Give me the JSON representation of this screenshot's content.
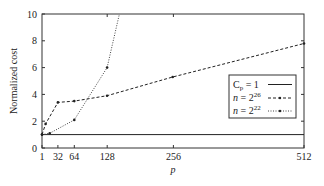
{
  "chart_data": {
    "type": "line",
    "title": "",
    "xlabel": "p",
    "ylabel": "Normalized cost",
    "xlim": [
      1,
      512
    ],
    "ylim": [
      0,
      10
    ],
    "x_ticks": [
      1,
      32,
      64,
      128,
      256,
      512
    ],
    "y_ticks": [
      0,
      2,
      4,
      6,
      8,
      10
    ],
    "grid": false,
    "legend_position": "right, mid",
    "series": [
      {
        "name": "C_p = 1",
        "style": "solid",
        "x": [
          1,
          512
        ],
        "y": [
          1,
          1
        ]
      },
      {
        "name": "n = 2^26",
        "style": "dashed",
        "x": [
          1,
          8,
          32,
          64,
          128,
          256,
          512
        ],
        "y": [
          1.0,
          1.8,
          3.4,
          3.5,
          3.9,
          5.3,
          7.8
        ]
      },
      {
        "name": "n = 2^22",
        "style": "dotted",
        "x": [
          1,
          16,
          64,
          128,
          152
        ],
        "y": [
          1.0,
          1.1,
          2.1,
          6.0,
          10.0
        ]
      }
    ]
  },
  "labels": {
    "xlabel": "p",
    "ylabel": "Normalized cost",
    "x_ticks": [
      "1",
      "32",
      "64",
      "128",
      "256",
      "512"
    ],
    "y_ticks": [
      "0",
      "2",
      "4",
      "6",
      "8",
      "10"
    ]
  },
  "legend": {
    "items": [
      {
        "base": "C",
        "sub": "p",
        "rest": " = 1",
        "sup": ""
      },
      {
        "base": "n",
        "sub": "",
        "rest": " = 2",
        "sup": "26"
      },
      {
        "base": "n",
        "sub": "",
        "rest": " = 2",
        "sup": "22"
      }
    ]
  }
}
